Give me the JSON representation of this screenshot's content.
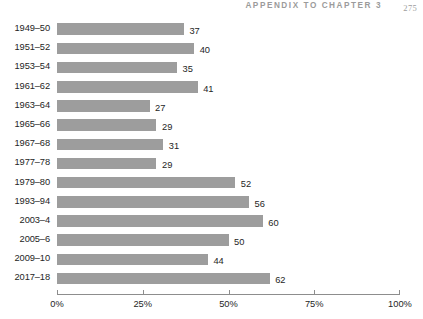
{
  "running_head": {
    "title": "APPENDIX TO CHAPTER 3",
    "page_number": "275"
  },
  "chart_data": {
    "type": "bar",
    "orientation": "horizontal",
    "title": "",
    "subtitle": "",
    "xlabel": "",
    "ylabel": "",
    "xlim": [
      0,
      100
    ],
    "grid": false,
    "legend": null,
    "value_suffix": "",
    "axis_unit": "%",
    "bar_color": "#9d9d9d",
    "text_color": "#252525",
    "axis_color": "#8d8d8d",
    "tick_labels": [
      "0%",
      "25%",
      "50%",
      "75%",
      "100%"
    ],
    "tick_values": [
      0,
      25,
      50,
      75,
      100
    ],
    "categories": [
      "1949–50",
      "1951–52",
      "1953–54",
      "1961–62",
      "1963–64",
      "1965–66",
      "1967–68",
      "1977–78",
      "1979–80",
      "1993–94",
      "2003–4",
      "2005–6",
      "2009–10",
      "2017–18"
    ],
    "values": [
      37,
      40,
      35,
      41,
      27,
      29,
      31,
      29,
      52,
      56,
      60,
      50,
      44,
      62
    ],
    "value_labels": [
      "37",
      "40",
      "35",
      "41",
      "27",
      "29",
      "31",
      "29",
      "52",
      "56",
      "60",
      "50",
      "44",
      "62"
    ]
  }
}
